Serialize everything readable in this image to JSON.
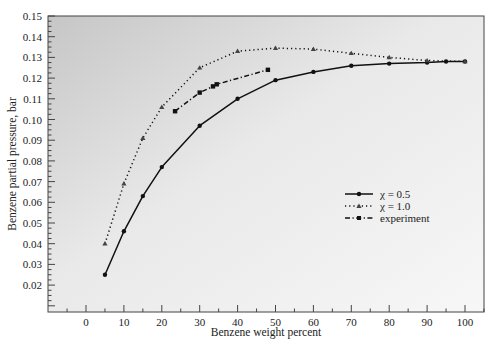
{
  "chart_data": {
    "type": "line",
    "title": "",
    "xlabel": "Benzene weight percent",
    "ylabel": "Benzene partial pressure, bar",
    "xlim": [
      -10,
      105
    ],
    "ylim": [
      0.0085,
      0.15
    ],
    "xticks": [
      0,
      10,
      20,
      30,
      40,
      50,
      60,
      70,
      80,
      90,
      100
    ],
    "yticks": [
      0.02,
      0.03,
      0.04,
      0.05,
      0.06,
      0.07,
      0.08,
      0.09,
      0.1,
      0.11,
      0.12,
      0.13,
      0.14,
      0.15
    ],
    "ytick_labels": [
      "0.02",
      "0.03",
      "0.04",
      "0.05",
      "0.06",
      "0.07",
      "0.08",
      "0.09",
      "0.10",
      "0.11",
      "0.12",
      "0.13",
      "0.14",
      "0.15"
    ],
    "grid": false,
    "legend_position": "center-right",
    "series": [
      {
        "name": "χ = 0.5",
        "style": "solid",
        "marker": "circle",
        "x": [
          5,
          10,
          15,
          20,
          30,
          40,
          50,
          60,
          70,
          80,
          90,
          95,
          100
        ],
        "y": [
          0.025,
          0.046,
          0.063,
          0.077,
          0.097,
          0.11,
          0.119,
          0.123,
          0.126,
          0.127,
          0.1275,
          0.128,
          0.128
        ]
      },
      {
        "name": "χ = 1.0",
        "style": "dotted",
        "marker": "triangle",
        "x": [
          5,
          10,
          15,
          20,
          30,
          40,
          50,
          60,
          70,
          80,
          90,
          100
        ],
        "y": [
          0.04,
          0.069,
          0.091,
          0.106,
          0.125,
          0.133,
          0.1345,
          0.134,
          0.132,
          0.13,
          0.1285,
          0.128
        ]
      },
      {
        "name": "experiment",
        "style": "dash-dot",
        "marker": "square",
        "x": [
          23.5,
          30,
          33.5,
          34.5,
          48
        ],
        "y": [
          0.104,
          0.113,
          0.116,
          0.117,
          0.124
        ]
      }
    ]
  },
  "legend": {
    "items": [
      {
        "label": "χ = 0.5"
      },
      {
        "label": "χ = 1.0"
      },
      {
        "label": "experiment"
      }
    ]
  },
  "colors": {
    "plot_bg_dark": "#c4c4c4",
    "plot_bg_light": "#f6f6f6",
    "line": "#111111"
  }
}
